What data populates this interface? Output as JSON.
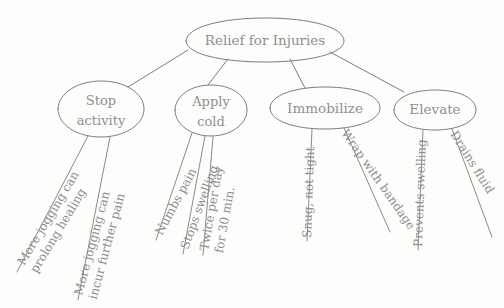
{
  "diagram": {
    "type": "concept-map",
    "title": "Relief for Injuries",
    "text_color": "#8f8f8f",
    "stroke_color": "#7d7d7d",
    "background_color": "#fdfdfc",
    "root": {
      "label": "Relief for Injuries",
      "cx": 265,
      "cy": 40,
      "rx": 79,
      "ry": 21
    },
    "branches": [
      {
        "id": "stop-activity",
        "label_line1": "Stop",
        "label_line2": "activity",
        "cx": 101,
        "cy": 109,
        "rx": 43,
        "ry": 28,
        "leaves": [
          {
            "id": "prolong-healing",
            "line1": "More jogging can",
            "line2": "prolong healing",
            "angle": -59,
            "x1": 88,
            "y1": 136,
            "x2": 17,
            "y2": 272,
            "tx": 24,
            "ty": 266
          },
          {
            "id": "incur-further-pain",
            "line1": "More jogging can",
            "line2": "incur further pain",
            "angle": -75,
            "x1": 110,
            "y1": 137,
            "x2": 78,
            "y2": 300,
            "tx": 82,
            "ty": 296
          }
        ]
      },
      {
        "id": "apply-cold",
        "label_line1": "Apply",
        "label_line2": "cold",
        "cx": 211,
        "cy": 110,
        "rx": 36,
        "ry": 26,
        "leaves": [
          {
            "id": "numbs-pain",
            "line1": "Numbs pain",
            "line2": "",
            "angle": -62,
            "x1": 192,
            "y1": 133,
            "x2": 156,
            "y2": 240,
            "tx": 162,
            "ty": 236
          },
          {
            "id": "stops-swelling",
            "line1": "Stops swelling",
            "line2": "",
            "angle": -70,
            "x1": 205,
            "y1": 136,
            "x2": 183,
            "y2": 254,
            "tx": 188,
            "ty": 250
          },
          {
            "id": "twice-per-day",
            "line1": "Twice per day",
            "line2": "for 30 min.",
            "angle": -80,
            "x1": 213,
            "y1": 137,
            "x2": 203,
            "y2": 255,
            "tx": 208,
            "ty": 251
          }
        ]
      },
      {
        "id": "immobilize",
        "label_line1": "Immobilize",
        "label_line2": "",
        "cx": 325,
        "cy": 108,
        "rx": 55,
        "ry": 21
      },
      {
        "id": "elevate",
        "label_line1": "Elevate",
        "label_line2": "",
        "cx": 435,
        "cy": 110,
        "rx": 41,
        "ry": 20
      }
    ],
    "immobilize_leaves": [
      {
        "id": "snug-not-tight",
        "line1": "Snug, not tight",
        "line2": "",
        "angle": -88,
        "x1": 312,
        "y1": 129,
        "x2": 307,
        "y2": 241,
        "tx": 311,
        "ty": 238
      },
      {
        "id": "wrap-with-bandage",
        "line1": "Wrap with bandage",
        "line2": "",
        "angle": -55,
        "x1": 344,
        "y1": 128,
        "x2": 390,
        "y2": 232,
        "tx": 341,
        "ty": 133
      }
    ],
    "elevate_leaves": [
      {
        "id": "prevents-swelling",
        "line1": "Prevents swelling",
        "line2": "",
        "angle": -88,
        "x1": 423,
        "y1": 130,
        "x2": 418,
        "y2": 250,
        "tx": 422,
        "ty": 247
      },
      {
        "id": "drains-fluid",
        "line1": "Drains fluid",
        "line2": "",
        "angle": -58,
        "x1": 452,
        "y1": 129,
        "x2": 492,
        "y2": 237,
        "tx": 450,
        "ty": 134
      }
    ],
    "root_edges": [
      {
        "id": "edge-root-stop",
        "x1": 188,
        "y1": 50,
        "x2": 128,
        "y2": 87
      },
      {
        "id": "edge-root-apply",
        "x1": 228,
        "y1": 59,
        "x2": 208,
        "y2": 85
      },
      {
        "id": "edge-root-immobilize",
        "x1": 290,
        "y1": 59,
        "x2": 305,
        "y2": 88
      },
      {
        "id": "edge-root-elevate",
        "x1": 330,
        "y1": 52,
        "x2": 404,
        "y2": 92
      }
    ]
  }
}
